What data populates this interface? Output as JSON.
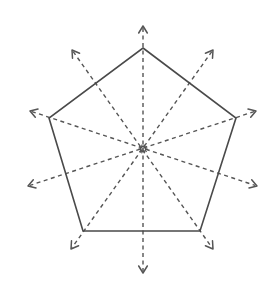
{
  "diagram": {
    "title": "",
    "colors": {
      "background": "#ffffff",
      "outline": "#4a4a4a",
      "axes": "#555555"
    },
    "center": {
      "x": 143,
      "y": 149,
      "icon": "starburst-center-icon"
    },
    "pentagon_vertices": [
      {
        "name": "top",
        "x": 143,
        "y": 48
      },
      {
        "name": "right",
        "x": 236,
        "y": 118
      },
      {
        "name": "bottom-right",
        "x": 200,
        "y": 231
      },
      {
        "name": "bottom-left",
        "x": 83,
        "y": 231
      },
      {
        "name": "left",
        "x": 49,
        "y": 118
      }
    ],
    "symmetry_lines": [
      {
        "name": "vertical",
        "from": {
          "x": 143,
          "y": 26
        },
        "to": {
          "x": 143,
          "y": 273
        }
      },
      {
        "name": "upper-left-to-lower-right",
        "from": {
          "x": 72,
          "y": 50
        },
        "to": {
          "x": 213,
          "y": 249
        }
      },
      {
        "name": "upper-right-to-lower-left",
        "from": {
          "x": 213,
          "y": 50
        },
        "to": {
          "x": 71,
          "y": 249
        }
      },
      {
        "name": "left-to-lower-right",
        "from": {
          "x": 30,
          "y": 111
        },
        "to": {
          "x": 257,
          "y": 186
        }
      },
      {
        "name": "right-to-lower-left",
        "from": {
          "x": 256,
          "y": 111
        },
        "to": {
          "x": 28,
          "y": 186
        }
      }
    ],
    "line_count": 5,
    "arrow_count": 10
  }
}
